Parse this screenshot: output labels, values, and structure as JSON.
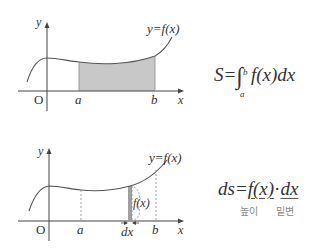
{
  "top_graph": {
    "axis_y": "y",
    "axis_x": "x",
    "origin": "O",
    "curve_label": "y=f(x)",
    "a_label": "a",
    "b_label": "b",
    "shade_color": "#c8c8c8"
  },
  "top_formula": {
    "lhs": "S=",
    "upper": "b",
    "lower": "a",
    "integrand": "f(x)dx"
  },
  "bottom_graph": {
    "axis_y": "y",
    "axis_x": "x",
    "origin": "O",
    "curve_label": "y=f(x)",
    "a_label": "a",
    "b_label": "b",
    "dx_label": "dx",
    "height_label": "f(x)",
    "strip_color": "#a0a0a0"
  },
  "bottom_formula": {
    "lhs": "ds=",
    "height": "f(x)",
    "dot": "·",
    "width": "dx",
    "height_caption": "높이",
    "width_caption": "밑변"
  }
}
